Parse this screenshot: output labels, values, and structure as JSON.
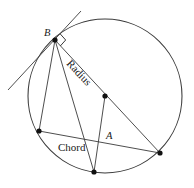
{
  "figure": {
    "kind": "circle-geometry-diagram",
    "background_color": "#ffffff",
    "stroke_color": "#3a3a3a",
    "label_color": "#1a1a1a",
    "width": 194,
    "height": 188
  },
  "labels": {
    "point_b": "B",
    "point_a": "A",
    "radius": "Radius",
    "chord": "Chord"
  },
  "geometry": {
    "circle": {
      "cx": 105,
      "cy": 96,
      "r": 77
    },
    "points": {
      "b": {
        "x": 55,
        "y": 40
      },
      "center": {
        "x": 105,
        "y": 96
      },
      "chord_left": {
        "x": 39,
        "y": 131
      },
      "right": {
        "x": 160,
        "y": 153
      },
      "bottom": {
        "x": 94,
        "y": 172
      },
      "a": {
        "x": 101,
        "y": 142
      }
    },
    "tangent": {
      "x1": 81,
      "y1": 11,
      "x2": 8,
      "y2": 90
    },
    "segments": [
      {
        "name": "radius-b-to-right",
        "x1": 55,
        "y1": 40,
        "x2": 160,
        "y2": 153
      },
      {
        "name": "b-to-chord-left",
        "x1": 55,
        "y1": 40,
        "x2": 39,
        "y2": 131
      },
      {
        "name": "b-to-bottom",
        "x1": 55,
        "y1": 40,
        "x2": 94,
        "y2": 172
      },
      {
        "name": "chord-left-to-right",
        "x1": 39,
        "y1": 131,
        "x2": 160,
        "y2": 153
      },
      {
        "name": "center-to-bottom",
        "x1": 105,
        "y1": 96,
        "x2": 94,
        "y2": 172
      }
    ],
    "right_angle": {
      "at": "b",
      "size": 8,
      "between": [
        "tangent",
        "radius"
      ]
    }
  },
  "label_positions": {
    "point_b": {
      "x": 44,
      "y": 36,
      "rotation": 0
    },
    "point_a": {
      "x": 106,
      "y": 139,
      "rotation": 0
    },
    "radius": {
      "x": 66,
      "y": 64,
      "rotation": 47
    },
    "chord": {
      "x": 58,
      "y": 151,
      "rotation": 0
    }
  }
}
